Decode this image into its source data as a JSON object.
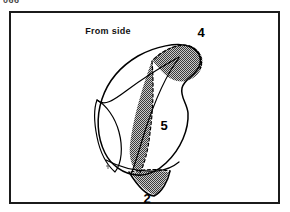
{
  "page": {
    "cropped_header_text": "066",
    "background_color": "#ffffff"
  },
  "figure": {
    "caption": "From side",
    "frame": {
      "border_color": "#1b1b1b",
      "fill_color": "#ffffff"
    },
    "labels": [
      {
        "id": "label-4",
        "text": "4",
        "x": 190,
        "y": 24
      },
      {
        "id": "label-5",
        "text": "5",
        "x": 153,
        "y": 117
      },
      {
        "id": "label-2",
        "text": "2",
        "x": 136,
        "y": 189
      }
    ],
    "colors": {
      "stroke": "#000000",
      "shading_fill": "#8d8d8d",
      "shading_fill_light": "#9a9a9a"
    },
    "shaded_regions": [
      {
        "id": "region-4",
        "label": "4",
        "description": "upper-right crescent cap"
      },
      {
        "id": "region-5",
        "label": "5",
        "description": "central lens-shaped band"
      },
      {
        "id": "region-2",
        "label": "2",
        "description": "lower pointed lobe"
      }
    ]
  }
}
